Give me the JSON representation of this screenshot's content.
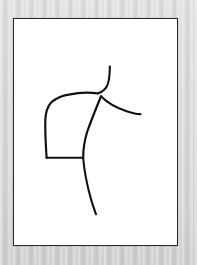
{
  "scene": {
    "width": 197,
    "height": 265,
    "surround_color": "#d2d2d2",
    "description": "Minimalist black ink line drawing of a human torso and shoulder in profile on a white sheet inside a thin dark rectangular frame"
  },
  "frame": {
    "x": 13,
    "y": 18,
    "width": 165,
    "height": 228,
    "border_color": "#2b2b2b",
    "border_width": 1.6,
    "paper_color": "#ffffff"
  },
  "artwork": {
    "title": "Torso and Shoulder Study",
    "medium": "ink line drawing",
    "stroke_color": "#111111",
    "viewbox": "0 0 165 228",
    "strokes": [
      {
        "name": "neck-line",
        "d": "M 97 48 C 97 56 97 62 94 68 C 91 73 88 74 85 75",
        "width": 2.1
      },
      {
        "name": "shoulder-line",
        "d": "M 85 75 C 76 74 66 74 57 76 C 50 77 45 79 42 81",
        "width": 2.2
      },
      {
        "name": "back-contour-line",
        "d": "M 42 81 C 36 84 33 90 32 98 C 31 110 32 124 33 140",
        "width": 2.2
      },
      {
        "name": "hem-line",
        "d": "M 33 140 L 70 140",
        "width": 2.1
      },
      {
        "name": "front-contour-line",
        "d": "M 88 78 C 84 88 79 100 74 114 C 71 124 70 133 70 140",
        "width": 2.2
      },
      {
        "name": "arm-line",
        "d": "M 88 78 C 95 85 104 90 114 93 C 120 95 125 96 128 96",
        "width": 2.1
      },
      {
        "name": "leg-line",
        "d": "M 70 140 C 71 152 74 168 78 182 C 80 189 82 194 83 197",
        "width": 2.1
      }
    ]
  }
}
